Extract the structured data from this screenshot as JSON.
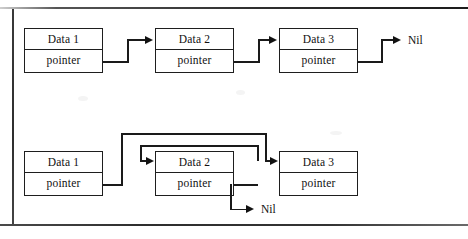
{
  "figure": {
    "ink_color": "#1a1a1a",
    "paper_color": "#ffffff"
  },
  "diagrams": [
    {
      "id": "linked-list-intact",
      "name": "singly-linked-list",
      "nodes": [
        {
          "id": "node-1",
          "data_label": "Data 1",
          "pointer_label": "pointer"
        },
        {
          "id": "node-2",
          "data_label": "Data 2",
          "pointer_label": "pointer"
        },
        {
          "id": "node-3",
          "data_label": "Data 3",
          "pointer_label": "pointer"
        }
      ],
      "terminator": "Nil",
      "links": [
        {
          "from": "node-1",
          "to": "node-2"
        },
        {
          "from": "node-2",
          "to": "node-3"
        },
        {
          "from": "node-3",
          "to": "Nil"
        }
      ]
    },
    {
      "id": "linked-list-relinked",
      "name": "linked-list-after-deletion",
      "nodes": [
        {
          "id": "node-1",
          "data_label": "Data 1",
          "pointer_label": "pointer"
        },
        {
          "id": "node-2",
          "data_label": "Data 2",
          "pointer_label": "pointer"
        },
        {
          "id": "node-3",
          "data_label": "Data 3",
          "pointer_label": "pointer"
        }
      ],
      "terminator": "Nil",
      "links": [
        {
          "from": "node-1",
          "to": "node-3"
        },
        {
          "from": "node-3",
          "to": "node-2"
        },
        {
          "from": "node-2",
          "to": "Nil"
        }
      ]
    }
  ]
}
